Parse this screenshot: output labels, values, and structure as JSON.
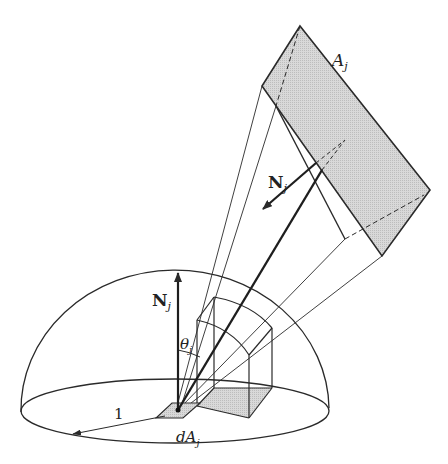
{
  "figure": {
    "type": "form-factor hemisphere projection diagram",
    "labels": {
      "area": "A",
      "area_sub": "j",
      "normal_far": "N",
      "normal_far_sub": "j",
      "normal_near": "N",
      "normal_near_sub": "j",
      "angle": "θ",
      "angle_sub": "j",
      "radius": "1",
      "diff_area": "dA",
      "diff_area_sub": "j"
    },
    "colors": {
      "stroke": "#2a2a2a",
      "fill_shaded": "#d4d4d4",
      "background": "#ffffff"
    }
  }
}
